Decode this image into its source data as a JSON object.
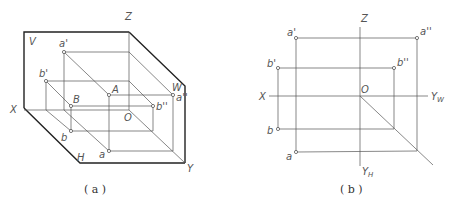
{
  "panel_a": {
    "caption": "( a )",
    "labels": {
      "V": "V",
      "Z": "Z",
      "W": "W",
      "X": "X",
      "Y": "Y",
      "H": "H",
      "O": "O",
      "A": "A",
      "B": "B",
      "a_prime": "a'",
      "b_prime": "b'",
      "a_dprime": "a''",
      "b_dprime": "b''",
      "a": "a",
      "b": "b"
    }
  },
  "panel_b": {
    "caption": "( b )",
    "labels": {
      "Z": "Z",
      "X": "X",
      "O": "O",
      "YW": "Y",
      "YW_sub": "W",
      "YH": "Y",
      "YH_sub": "H",
      "a_prime": "a'",
      "b_prime": "b'",
      "a_dprime": "a''",
      "b_dprime": "b''",
      "a": "a",
      "b": "b"
    }
  }
}
